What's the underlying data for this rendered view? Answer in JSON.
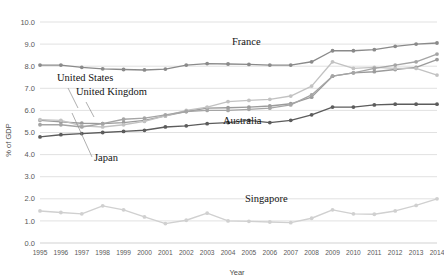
{
  "chart_data": {
    "type": "line",
    "title": "",
    "xlabel": "Year",
    "ylabel": "% of GDP",
    "x": [
      1995,
      1996,
      1997,
      1998,
      1999,
      2000,
      2001,
      2002,
      2003,
      2004,
      2005,
      2006,
      2007,
      2008,
      2009,
      2010,
      2011,
      2012,
      2013,
      2014
    ],
    "categories": [
      "1995",
      "1996",
      "1997",
      "1998",
      "1999",
      "2000",
      "2001",
      "2002",
      "2003",
      "2004",
      "2005",
      "2006",
      "2007",
      "2008",
      "2009",
      "2010",
      "2011",
      "2012",
      "2013",
      "2014"
    ],
    "ylim": [
      0.0,
      10.0
    ],
    "ytick_step": 1.0,
    "yticks": [
      "0.0",
      "1.0",
      "2.0",
      "3.0",
      "4.0",
      "5.0",
      "6.0",
      "7.0",
      "8.0",
      "9.0",
      "10.0"
    ],
    "grid": true,
    "legend": "annotations-inline",
    "series": [
      {
        "name": "France",
        "color": "#8a8a8a",
        "values": [
          8.05,
          8.05,
          7.95,
          7.88,
          7.85,
          7.83,
          7.87,
          8.05,
          8.12,
          8.1,
          8.08,
          8.05,
          8.05,
          8.2,
          8.7,
          8.7,
          8.75,
          8.9,
          9.0,
          9.05
        ]
      },
      {
        "name": "United States",
        "color": "#9b9b9b",
        "values": [
          5.55,
          5.48,
          5.42,
          5.4,
          5.45,
          5.55,
          5.75,
          5.95,
          6.1,
          6.12,
          6.15,
          6.2,
          6.3,
          6.6,
          7.55,
          7.7,
          7.75,
          7.85,
          7.95,
          8.3
        ]
      },
      {
        "name": "United Kingdom",
        "color": "#c2c2c2",
        "values": [
          5.58,
          5.55,
          5.3,
          5.25,
          5.35,
          5.5,
          5.75,
          6.0,
          6.15,
          6.4,
          6.45,
          6.5,
          6.65,
          7.1,
          8.2,
          7.9,
          7.95,
          7.9,
          7.9,
          7.6
        ]
      },
      {
        "name": "Japan",
        "color": "#a5a5a5",
        "values": [
          5.35,
          5.35,
          5.25,
          5.4,
          5.6,
          5.65,
          5.8,
          5.95,
          6.0,
          6.0,
          6.05,
          6.1,
          6.25,
          6.7,
          7.55,
          7.7,
          7.9,
          8.05,
          8.2,
          8.55
        ]
      },
      {
        "name": "Australia",
        "color": "#5c5c5c",
        "values": [
          4.8,
          4.9,
          4.95,
          5.0,
          5.05,
          5.1,
          5.25,
          5.3,
          5.4,
          5.45,
          5.55,
          5.45,
          5.55,
          5.8,
          6.15,
          6.15,
          6.25,
          6.28,
          6.28,
          6.28
        ]
      },
      {
        "name": "Singapore",
        "color": "#d0d0d0",
        "values": [
          1.45,
          1.38,
          1.32,
          1.68,
          1.5,
          1.18,
          0.88,
          1.03,
          1.35,
          1.0,
          0.98,
          0.95,
          0.92,
          1.12,
          1.5,
          1.32,
          1.3,
          1.45,
          1.7,
          2.0
        ]
      }
    ],
    "annotations": [
      {
        "name": "france",
        "label": "France",
        "x": 232,
        "y": 45
      },
      {
        "name": "united-states",
        "label": "United States",
        "x": 57,
        "y": 81
      },
      {
        "name": "united-kingdom",
        "label": "United Kingdom",
        "x": 76,
        "y": 95
      },
      {
        "name": "japan",
        "label": "Japan",
        "x": 94,
        "y": 161
      },
      {
        "name": "australia",
        "label": "Australia",
        "x": 223,
        "y": 124
      },
      {
        "name": "singapore",
        "label": "Singapore",
        "x": 245,
        "y": 202
      }
    ]
  }
}
